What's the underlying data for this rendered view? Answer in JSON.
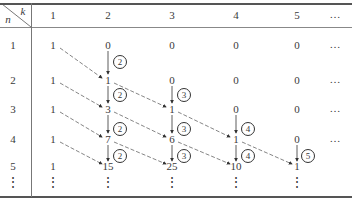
{
  "table": {
    "corner": {
      "row_label": "n",
      "col_label": "k"
    },
    "column_headers": [
      "1",
      "2",
      "3",
      "4",
      "5",
      "…"
    ],
    "rows": [
      {
        "n": "1",
        "values": [
          "1",
          "0",
          "0",
          "0",
          "0"
        ],
        "trailing": "…"
      },
      {
        "n": "2",
        "values": [
          "1",
          "1",
          "0",
          "0",
          "0"
        ],
        "trailing": "…"
      },
      {
        "n": "3",
        "values": [
          "1",
          "3",
          "1",
          "0",
          "0"
        ],
        "trailing": "…"
      },
      {
        "n": "4",
        "values": [
          "1",
          "7",
          "6",
          "1",
          "0"
        ],
        "trailing": "…"
      },
      {
        "n": "5",
        "values": [
          "1",
          "15",
          "25",
          "10",
          "1"
        ],
        "trailing": ""
      }
    ],
    "continuation": "⋮",
    "multipliers": [
      {
        "label": "2",
        "col": 2,
        "between_rows": [
          1,
          2
        ]
      },
      {
        "label": "2",
        "col": 2,
        "between_rows": [
          2,
          3
        ]
      },
      {
        "label": "3",
        "col": 3,
        "between_rows": [
          2,
          3
        ]
      },
      {
        "label": "2",
        "col": 2,
        "between_rows": [
          3,
          4
        ]
      },
      {
        "label": "3",
        "col": 3,
        "between_rows": [
          3,
          4
        ]
      },
      {
        "label": "4",
        "col": 4,
        "between_rows": [
          3,
          4
        ]
      },
      {
        "label": "2",
        "col": 2,
        "between_rows": [
          4,
          5
        ]
      },
      {
        "label": "3",
        "col": 3,
        "between_rows": [
          4,
          5
        ]
      },
      {
        "label": "4",
        "col": 4,
        "between_rows": [
          4,
          5
        ]
      },
      {
        "label": "5",
        "col": 5,
        "between_rows": [
          4,
          5
        ]
      }
    ]
  }
}
